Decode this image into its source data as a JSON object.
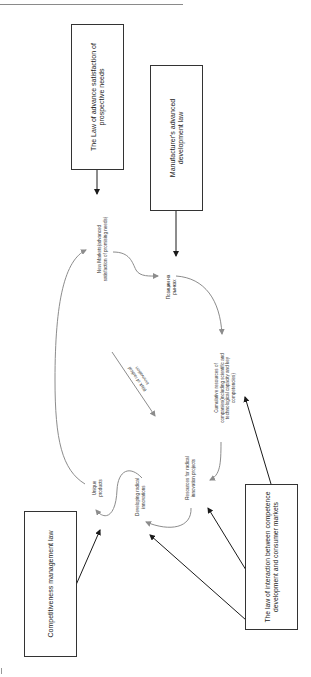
{
  "diagram": {
    "type": "flow-cycle",
    "orientation": "rotated-90-degrees",
    "boxes": {
      "law_prospective_needs": "The Law of advance satisfaction of prospective needs",
      "manufacturer_development": "Manufacturer's advanced development law",
      "competitiveness_management": "Competitiveness management law",
      "competence_interaction": "The law of interaction between competence development and consumer markets"
    },
    "nodes": {
      "new_markets": "New Markets(advanced satisfaction of promising needs)",
      "market_position": "Позиции на рынках",
      "cumulative_resources": "Cumulative resources of companies(including scientific and technological capacity and key competencies)",
      "resources_radical": "Resources for radical innovation projects",
      "developing_radical": "Developing radical innovations",
      "unique_products": "Unique products"
    },
    "center_label": "Risk of radical innovation",
    "colors": {
      "box_border": "#333333",
      "flow_arrow": "#8c8c8c",
      "law_arrow": "#1a1a1a"
    }
  }
}
